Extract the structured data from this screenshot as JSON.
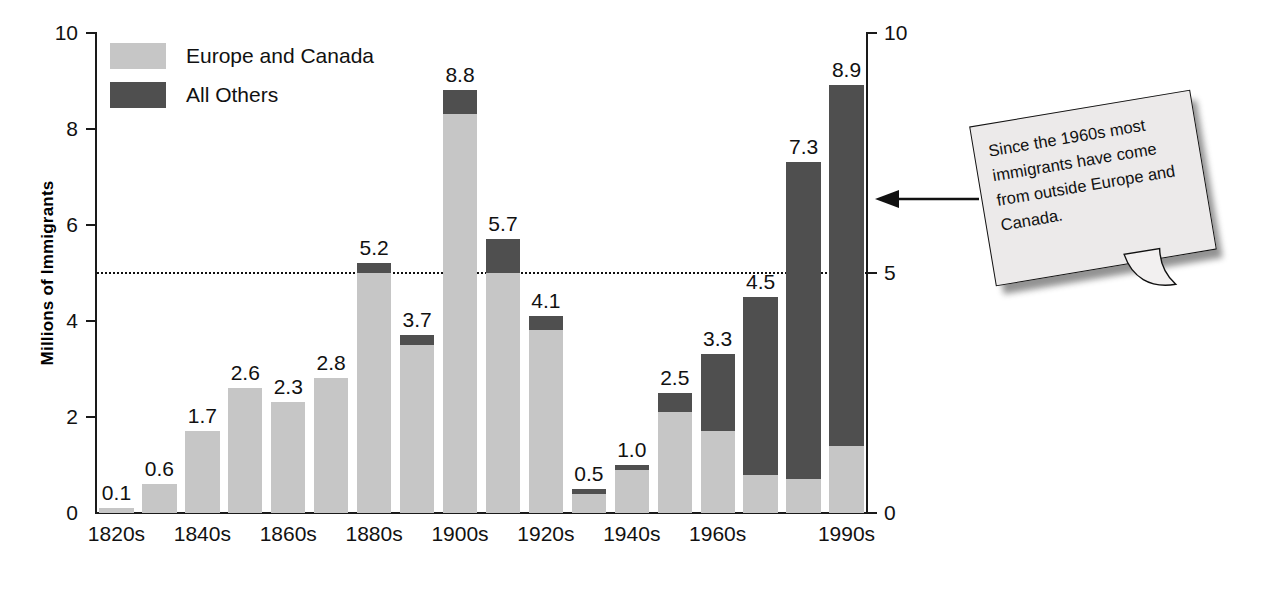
{
  "chart_data": {
    "type": "bar",
    "subtype": "stacked-bar",
    "title": "",
    "xlabel": "",
    "ylabel": "Millions of Immigrants",
    "ylim": [
      0,
      10
    ],
    "y_ticks": [
      0,
      2,
      4,
      6,
      8,
      10
    ],
    "y_ticks_right": [
      0,
      5,
      10
    ],
    "grid": false,
    "reference_line": {
      "value": 5,
      "style": "dotted"
    },
    "legend": {
      "position": "top-left",
      "entries": [
        {
          "name": "Europe and Canada",
          "color": "#c6c6c6"
        },
        {
          "name": "All Others",
          "color": "#4f4f4f"
        }
      ]
    },
    "categories": [
      "1820s",
      "1830s",
      "1840s",
      "1850s",
      "1860s",
      "1870s",
      "1880s",
      "1890s",
      "1900s",
      "1910s",
      "1920s",
      "1930s",
      "1940s",
      "1950s",
      "1960s",
      "1970s",
      "1980s",
      "1990s"
    ],
    "tick_labels_shown": [
      "1820s",
      "1840s",
      "1860s",
      "1880s",
      "1900s",
      "1920s",
      "1940s",
      "1960s",
      "1990s"
    ],
    "totals": [
      0.1,
      0.6,
      1.7,
      2.6,
      2.3,
      2.8,
      5.2,
      3.7,
      8.8,
      5.7,
      4.1,
      0.5,
      1.0,
      2.5,
      3.3,
      4.5,
      7.3,
      8.9
    ],
    "series": [
      {
        "name": "Europe and Canada",
        "color": "#c6c6c6",
        "values": [
          0.1,
          0.6,
          1.7,
          2.6,
          2.3,
          2.8,
          5.0,
          3.5,
          8.3,
          5.0,
          3.8,
          0.4,
          0.9,
          2.1,
          1.7,
          0.8,
          0.7,
          1.4
        ]
      },
      {
        "name": "All Others",
        "color": "#4f4f4f",
        "values": [
          0.0,
          0.0,
          0.0,
          0.0,
          0.0,
          0.0,
          0.2,
          0.2,
          0.5,
          0.7,
          0.3,
          0.1,
          0.1,
          0.4,
          1.6,
          3.7,
          6.6,
          7.5
        ]
      }
    ],
    "value_labels": [
      "0.1",
      "0.6",
      "1.7",
      "2.6",
      "2.3",
      "2.8",
      "5.2",
      "3.7",
      "8.8",
      "5.7",
      "4.1",
      "0.5",
      "1.0",
      "2.5",
      "3.3",
      "4.5",
      "7.3",
      "8.9"
    ]
  },
  "axes": {
    "y_title": "Millions of Immigrants",
    "left_ticks": [
      "10",
      "8",
      "6",
      "4",
      "2",
      "0"
    ],
    "right_ticks": [
      "10",
      "5",
      "0"
    ]
  },
  "legend": {
    "items": [
      {
        "label": "Europe and Canada",
        "color": "#c6c6c6"
      },
      {
        "label": "All Others",
        "color": "#4f4f4f"
      }
    ]
  },
  "callout": {
    "text": "Since the 1960s most immigrants have come from outside Europe and Canada."
  }
}
